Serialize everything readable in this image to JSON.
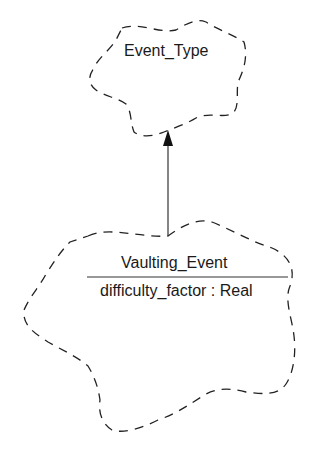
{
  "diagram": {
    "type": "booch-class-diagram",
    "classes": [
      {
        "id": "event_type",
        "name": "Event_Type",
        "attributes": []
      },
      {
        "id": "vaulting_event",
        "name": "Vaulting_Event",
        "attributes": [
          "difficulty_factor : Real"
        ]
      }
    ],
    "relationships": [
      {
        "type": "inheritance",
        "from": "Vaulting_Event",
        "to": "Event_Type"
      }
    ],
    "colors": {
      "stroke": "#222222",
      "background": "#ffffff"
    }
  }
}
